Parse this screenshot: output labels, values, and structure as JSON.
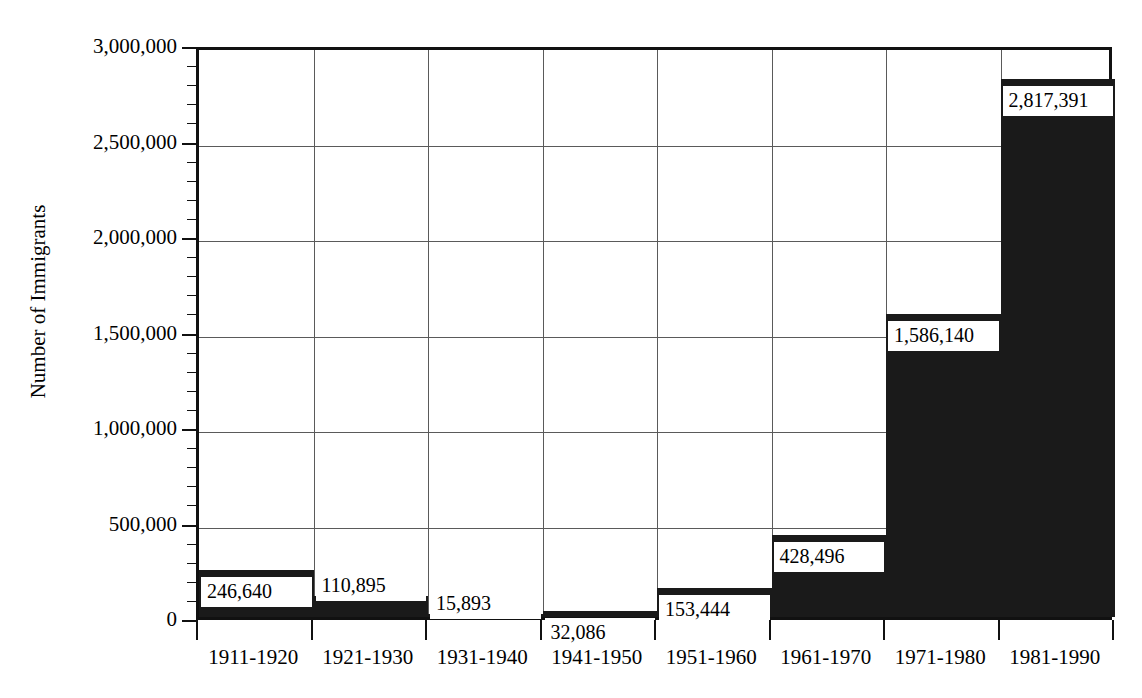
{
  "chart_data": {
    "type": "bar",
    "title": "",
    "subtitle": "",
    "xlabel": "",
    "ylabel": "Number of Immigrants",
    "categories": [
      "1911-1920",
      "1921-1930",
      "1931-1940",
      "1941-1950",
      "1951-1960",
      "1961-1970",
      "1971-1980",
      "1981-1990"
    ],
    "values": [
      246640,
      110895,
      15893,
      32086,
      153444,
      428496,
      1586140,
      2817391
    ],
    "value_labels": [
      "246,640",
      "110,895",
      "15,893",
      "32,086",
      "153,444",
      "428,496",
      "1,586,140",
      "2,817,391"
    ],
    "ylim": [
      0,
      3000000
    ],
    "ytick_values": [
      0,
      500000,
      1000000,
      1500000,
      2000000,
      2500000,
      3000000
    ],
    "ytick_labels": [
      "0",
      "500,000",
      "1,000,000",
      "1,500,000",
      "2,000,000",
      "2,500,000",
      "3,000,000"
    ],
    "yminor_interval": 100000,
    "grid": "both",
    "legend": "none",
    "bar_color": "#1a1a1a",
    "grid_color": "#5a5a5a",
    "axis_color": "#111111",
    "background": "#ffffff",
    "bar_gap": 0
  }
}
